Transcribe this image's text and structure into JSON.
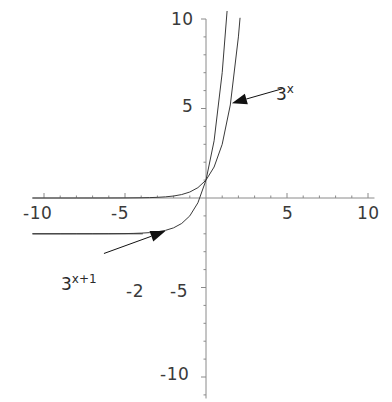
{
  "chart_data": {
    "type": "line",
    "title": "",
    "xlabel": "",
    "ylabel": "",
    "xlim": [
      -10.7,
      10.4
    ],
    "ylim": [
      -11.2,
      10.0
    ],
    "grid": false,
    "legend_position": "inline-annotations",
    "x_ticks": [
      -10,
      -5,
      5,
      10
    ],
    "x_tick_labels": [
      "-10",
      "-5",
      "5",
      "10"
    ],
    "y_ticks": [
      10,
      5,
      -5,
      -10
    ],
    "y_tick_labels": [
      "10",
      "5",
      "-5",
      "-10"
    ],
    "axis_color": "#8a8a8a",
    "curve_color": "#3a3a3a",
    "annotation_color": "#111111",
    "series": [
      {
        "name": "3^x",
        "label_base": "3",
        "label_exponent": "x",
        "expression": "y = 3^x",
        "asymptote": 0,
        "points": [
          {
            "x": -10.7,
            "y": 0.0
          },
          {
            "x": -9.0,
            "y": 0.0001
          },
          {
            "x": -8.0,
            "y": 0.0002
          },
          {
            "x": -7.0,
            "y": 0.0005
          },
          {
            "x": -6.0,
            "y": 0.0014
          },
          {
            "x": -5.0,
            "y": 0.0041
          },
          {
            "x": -4.0,
            "y": 0.0123
          },
          {
            "x": -3.5,
            "y": 0.0214
          },
          {
            "x": -3.0,
            "y": 0.037
          },
          {
            "x": -2.5,
            "y": 0.0642
          },
          {
            "x": -2.0,
            "y": 0.1111
          },
          {
            "x": -1.5,
            "y": 0.1925
          },
          {
            "x": -1.0,
            "y": 0.3333
          },
          {
            "x": -0.5,
            "y": 0.5774
          },
          {
            "x": 0.0,
            "y": 1.0
          },
          {
            "x": 0.5,
            "y": 1.7321
          },
          {
            "x": 1.0,
            "y": 3.0
          },
          {
            "x": 1.5,
            "y": 5.1962
          },
          {
            "x": 2.0,
            "y": 9.0
          },
          {
            "x": 2.1,
            "y": 10.0451
          }
        ]
      },
      {
        "name": "3^(x+1) - 2",
        "label_base": "3",
        "label_exponent": "x+1",
        "expression": "y = 3^(x+1) - 2",
        "asymptote": -2,
        "points": [
          {
            "x": -10.7,
            "y": -2.0
          },
          {
            "x": -9.0,
            "y": -1.9998
          },
          {
            "x": -8.0,
            "y": -1.9995
          },
          {
            "x": -7.0,
            "y": -1.9986
          },
          {
            "x": -6.0,
            "y": -1.9959
          },
          {
            "x": -5.0,
            "y": -1.9877
          },
          {
            "x": -4.5,
            "y": -1.9787
          },
          {
            "x": -4.0,
            "y": -1.963
          },
          {
            "x": -3.5,
            "y": -1.9358
          },
          {
            "x": -3.0,
            "y": -1.8889
          },
          {
            "x": -2.5,
            "y": -1.8075
          },
          {
            "x": -2.0,
            "y": -1.6667
          },
          {
            "x": -1.5,
            "y": -1.4226
          },
          {
            "x": -1.0,
            "y": -1.0
          },
          {
            "x": -0.5,
            "y": -0.2679
          },
          {
            "x": 0.0,
            "y": 1.0
          },
          {
            "x": 0.5,
            "y": 3.1962
          },
          {
            "x": 1.0,
            "y": 7.0
          },
          {
            "x": 1.3,
            "y": 10.4256
          }
        ]
      }
    ],
    "asymptote_lines": [
      {
        "for": "3^(x+1) - 2",
        "y": -2,
        "label": "-2",
        "x_from": -10.7,
        "x_to": -3.9
      }
    ],
    "annotations": [
      {
        "id": "label-3-to-x",
        "text_base": "3",
        "text_exponent": "x",
        "target_series": "3^x",
        "arrow_tip": {
          "x": 1.6,
          "y": 5.3
        },
        "arrow_tail": {
          "x": 4.7,
          "y": 6.1
        }
      },
      {
        "id": "label-3-to-x-plus-1",
        "text_base": "3",
        "text_exponent": "x+1",
        "target_series": "3^(x+1) - 2",
        "arrow_tip": {
          "x": -2.5,
          "y": -1.85
        },
        "arrow_tail": {
          "x": -6.3,
          "y": -3.1
        }
      }
    ]
  },
  "labels": {
    "x_neg10": "-10",
    "x_neg5": "-5",
    "x_pos5": "5",
    "x_pos10": "10",
    "y_pos10": "10",
    "y_pos5": "5",
    "y_neg5": "-5",
    "y_neg10": "-10",
    "asymptote_neg2": "-2",
    "curve1_base": "3",
    "curve1_exp": "x",
    "curve2_base": "3",
    "curve2_exp": "x+1"
  }
}
